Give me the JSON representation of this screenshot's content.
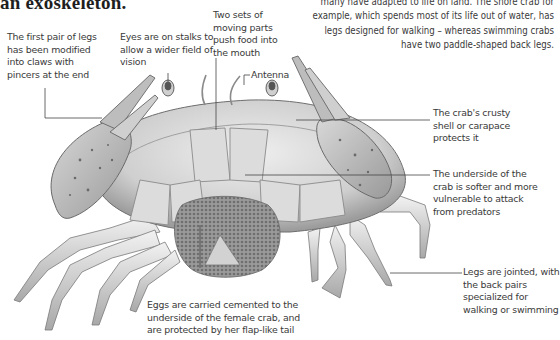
{
  "heading": "an exoskeleton.",
  "intro_text": "many have adapted to life on land. The shore crab for example, which spends most of its life out of water, has legs designed for walking – whereas swimming crabs have two paddle-shaped back legs.",
  "labels": {
    "claws": "The first pair of legs has been modified into claws with pincers at the end",
    "eyes": "Eyes are on stalks to allow a wider field of vision",
    "mouthparts": "Two sets of moving parts push food into the mouth",
    "antenna": "Antenna",
    "carapace": "The crab's crusty shell or carapace protects it",
    "underside": "The underside of the crab is softer and more vulnerable to attack from predators",
    "legs": "Legs are jointed, with the back pairs specialized for walking or swimming",
    "eggs": "Eggs are carried cemented to the underside of the female crab, and are protected by her flap-like tail"
  },
  "colors": {
    "text": "#3a3a3a",
    "leader_line": "#444444",
    "shell": "#c9c9c9",
    "claw_spots": "#6a6a6a",
    "eggs": "#8a8a8a"
  }
}
